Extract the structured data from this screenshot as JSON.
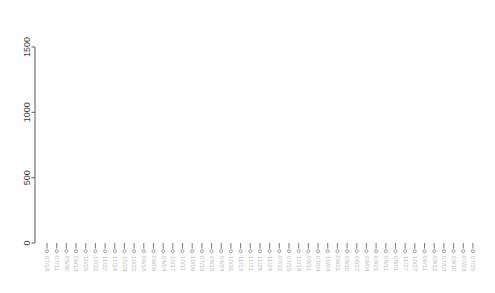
{
  "chart_data": {
    "type": "dendrogram",
    "title": "",
    "xlabel": "",
    "ylabel": "",
    "ylim": [
      0,
      1700
    ],
    "grid": false,
    "legend": null,
    "axis": {
      "ticks": [
        0,
        500,
        1000,
        1500
      ],
      "tick_labels": [
        "0",
        "500",
        "1000",
        "1500"
      ],
      "orientation": "left"
    },
    "leaf_label_rotation": 90,
    "leaf_count": 45,
    "leaf_labels": [
      "07/18",
      "07/11",
      "05/30",
      "06/13",
      "10/25",
      "10/22",
      "11/22",
      "11/24",
      "10/29",
      "10/22",
      "06/18",
      "06/06",
      "04/04",
      "10/17",
      "10/11",
      "10/06",
      "07/19",
      "05/15",
      "04/24",
      "10/31",
      "11/13",
      "11/21",
      "11/28",
      "11/24",
      "07/22",
      "07/15",
      "10/18",
      "09/11",
      "07/04",
      "10/04",
      "06/21",
      "09/10",
      "06/27",
      "09/04",
      "03/21",
      "08/11",
      "08/01",
      "11/27",
      "10/27",
      "06/11",
      "09/12",
      "07/03",
      "09/10",
      "07/23",
      "07/25"
    ],
    "merges": [
      {
        "id": "m1",
        "left": "leaf:1",
        "right": "leaf:2",
        "height": 860
      },
      {
        "id": "m2",
        "left": "m1",
        "right": "leaf:3",
        "height": 925
      },
      {
        "id": "m3",
        "left": "leaf:0",
        "right": "m2",
        "height": 1090
      },
      {
        "id": "m4",
        "left": "leaf:6",
        "right": "leaf:7",
        "height": 660
      },
      {
        "id": "m5",
        "left": "leaf:5",
        "right": "m4",
        "height": 820
      },
      {
        "id": "m6",
        "left": "leaf:4",
        "right": "m5",
        "height": 965
      },
      {
        "id": "m7",
        "left": "m3",
        "right": "m6",
        "height": 1370
      },
      {
        "id": "m8",
        "left": "leaf:9",
        "right": "leaf:10",
        "height": 875
      },
      {
        "id": "m9",
        "left": "leaf:8",
        "right": "m8",
        "height": 945
      },
      {
        "id": "m10",
        "left": "leaf:12",
        "right": "leaf:13",
        "height": 860
      },
      {
        "id": "m11",
        "left": "leaf:11",
        "right": "m10",
        "height": 930
      },
      {
        "id": "m12",
        "left": "m9",
        "right": "m11",
        "height": 1165
      },
      {
        "id": "m13",
        "left": "leaf:15",
        "right": "leaf:16",
        "height": 880
      },
      {
        "id": "m14",
        "left": "leaf:14",
        "right": "m13",
        "height": 1010
      },
      {
        "id": "m15",
        "left": "leaf:18",
        "right": "leaf:19",
        "height": 840
      },
      {
        "id": "m16",
        "left": "leaf:17",
        "right": "m15",
        "height": 900
      },
      {
        "id": "m17",
        "left": "m14",
        "right": "m16",
        "height": 1150
      },
      {
        "id": "m18",
        "left": "leaf:21",
        "right": "leaf:22",
        "height": 830
      },
      {
        "id": "m19",
        "left": "leaf:20",
        "right": "m18",
        "height": 930
      },
      {
        "id": "m20",
        "left": "leaf:24",
        "right": "leaf:25",
        "height": 855
      },
      {
        "id": "m21",
        "left": "leaf:23",
        "right": "m20",
        "height": 990
      },
      {
        "id": "m22",
        "left": "m19",
        "right": "m21",
        "height": 1115
      },
      {
        "id": "m23",
        "left": "m17",
        "right": "m22",
        "height": 1300
      },
      {
        "id": "m24",
        "left": "m12",
        "right": "m23",
        "height": 1480
      },
      {
        "id": "m25",
        "left": "leaf:27",
        "right": "leaf:28",
        "height": 880
      },
      {
        "id": "m26",
        "left": "leaf:26",
        "right": "m25",
        "height": 985
      },
      {
        "id": "m27",
        "left": "leaf:30",
        "right": "leaf:31",
        "height": 905
      },
      {
        "id": "m28",
        "left": "leaf:29",
        "right": "m27",
        "height": 1030
      },
      {
        "id": "m29",
        "left": "m26",
        "right": "m28",
        "height": 1225
      },
      {
        "id": "m30",
        "left": "leaf:33",
        "right": "leaf:34",
        "height": 930
      },
      {
        "id": "m31",
        "left": "leaf:32",
        "right": "m30",
        "height": 1040
      },
      {
        "id": "m32",
        "left": "leaf:36",
        "right": "leaf:37",
        "height": 895
      },
      {
        "id": "m33",
        "left": "leaf:35",
        "right": "m32",
        "height": 1025
      },
      {
        "id": "m34",
        "left": "m31",
        "right": "m33",
        "height": 1180
      },
      {
        "id": "m35",
        "left": "leaf:39",
        "right": "leaf:40",
        "height": 870
      },
      {
        "id": "m36",
        "left": "leaf:38",
        "right": "m35",
        "height": 1000
      },
      {
        "id": "m37",
        "left": "leaf:42",
        "right": "leaf:43",
        "height": 845
      },
      {
        "id": "m38",
        "left": "leaf:41",
        "right": "m37",
        "height": 935
      },
      {
        "id": "m39",
        "left": "m38",
        "right": "leaf:44",
        "height": 1065
      },
      {
        "id": "m40",
        "left": "m36",
        "right": "m39",
        "height": 1185
      },
      {
        "id": "m41",
        "left": "m34",
        "right": "m40",
        "height": 1400
      },
      {
        "id": "m42",
        "left": "m29",
        "right": "m41",
        "height": 1560
      },
      {
        "id": "m43",
        "left": "m24",
        "right": "m42",
        "height": 1620
      },
      {
        "id": "m44",
        "left": "m7",
        "right": "m43",
        "height": 1700
      }
    ]
  },
  "colors": {
    "link": "#6e6e6e",
    "axis": "#5a5a5a",
    "tick_label": "#3a3a3a",
    "leaf_label": "#b9b9b9",
    "background": "#fefefe"
  },
  "geometry": {
    "leaf_x_start": 47,
    "leaf_x_step": 9.68,
    "baseline_y": 243,
    "value_top_y": 47,
    "value_top": 1500,
    "axis_x": 35
  }
}
